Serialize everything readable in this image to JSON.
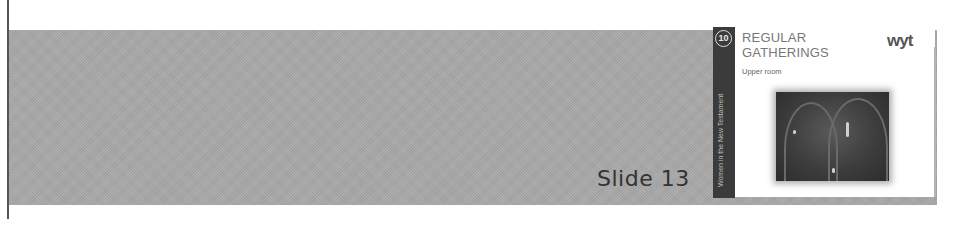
{
  "slide_label": "Slide 13",
  "thumbnail": {
    "sidebar": {
      "badge_number": "10",
      "vertical_text": "Women in the New Testament"
    },
    "title_line1": "REGULAR",
    "title_line2": "GATHERINGS",
    "subtitle": "Upper room",
    "logo_text": "wyt",
    "image": "church-interior-photo"
  },
  "colors": {
    "band": "#a8a8a8",
    "strip": "#3b3b3b",
    "title": "#777777"
  }
}
